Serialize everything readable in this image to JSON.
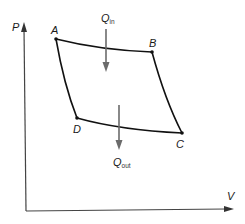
{
  "diagram": {
    "type": "P-V cycle diagram",
    "axes": {
      "y_label": "P",
      "x_label": "V"
    },
    "points": [
      {
        "id": "A",
        "label": "A"
      },
      {
        "id": "B",
        "label": "B"
      },
      {
        "id": "C",
        "label": "C"
      },
      {
        "id": "D",
        "label": "D"
      }
    ],
    "heat_in": {
      "symbol": "Q",
      "subscript": "in"
    },
    "heat_out": {
      "symbol": "Q",
      "subscript": "out"
    },
    "colors": {
      "curve": "#111111",
      "axis": "#444444",
      "heat_arrow": "#6b6b6b"
    }
  }
}
